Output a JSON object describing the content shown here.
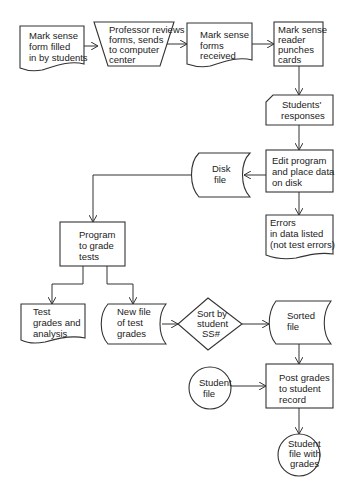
{
  "diagram": {
    "type": "flowchart",
    "nodes": [
      {
        "id": "n1",
        "shape": "document",
        "lines": [
          "Mark sense",
          "form filled",
          "in by students"
        ]
      },
      {
        "id": "n2",
        "shape": "manual-operation",
        "lines": [
          "Professor reviews",
          "forms, sends",
          "to computer",
          "center"
        ]
      },
      {
        "id": "n3",
        "shape": "document",
        "lines": [
          "Mark sense",
          "forms",
          "received"
        ]
      },
      {
        "id": "n4",
        "shape": "process",
        "lines": [
          "Mark sense",
          "reader",
          "punches",
          "cards"
        ]
      },
      {
        "id": "n5",
        "shape": "punched-card",
        "lines": [
          "Students'",
          "responses"
        ]
      },
      {
        "id": "n6",
        "shape": "process",
        "lines": [
          "Edit program",
          "and place data",
          "on disk"
        ]
      },
      {
        "id": "n7",
        "shape": "stored-data",
        "lines": [
          "Disk",
          "file"
        ]
      },
      {
        "id": "n8",
        "shape": "document",
        "lines": [
          "Errors",
          "in data listed",
          "(not test errors)"
        ]
      },
      {
        "id": "n9",
        "shape": "process",
        "lines": [
          "Program",
          "to grade",
          "tests"
        ]
      },
      {
        "id": "n10",
        "shape": "document",
        "lines": [
          "Test",
          "grades and",
          "analysis"
        ]
      },
      {
        "id": "n11",
        "shape": "stored-data",
        "lines": [
          "New file",
          "of test",
          "grades"
        ]
      },
      {
        "id": "n12",
        "shape": "decision",
        "lines": [
          "Sort by",
          "student",
          "SS#"
        ]
      },
      {
        "id": "n13",
        "shape": "stored-data",
        "lines": [
          "Sorted",
          "file"
        ]
      },
      {
        "id": "n14",
        "shape": "connector-circle",
        "lines": [
          "Student",
          "file"
        ]
      },
      {
        "id": "n15",
        "shape": "process",
        "lines": [
          "Post grades",
          "to student",
          "record"
        ]
      },
      {
        "id": "n16",
        "shape": "connector-circle",
        "lines": [
          "Student",
          "file with",
          "grades"
        ]
      }
    ],
    "edges": [
      [
        "n1",
        "n2"
      ],
      [
        "n2",
        "n3"
      ],
      [
        "n3",
        "n4"
      ],
      [
        "n4",
        "n5"
      ],
      [
        "n5",
        "n6"
      ],
      [
        "n6",
        "n7"
      ],
      [
        "n6",
        "n8"
      ],
      [
        "n7",
        "n9"
      ],
      [
        "n9",
        "n10"
      ],
      [
        "n9",
        "n11"
      ],
      [
        "n11",
        "n12"
      ],
      [
        "n12",
        "n13"
      ],
      [
        "n13",
        "n15"
      ],
      [
        "n14",
        "n15"
      ],
      [
        "n15",
        "n16"
      ]
    ]
  }
}
